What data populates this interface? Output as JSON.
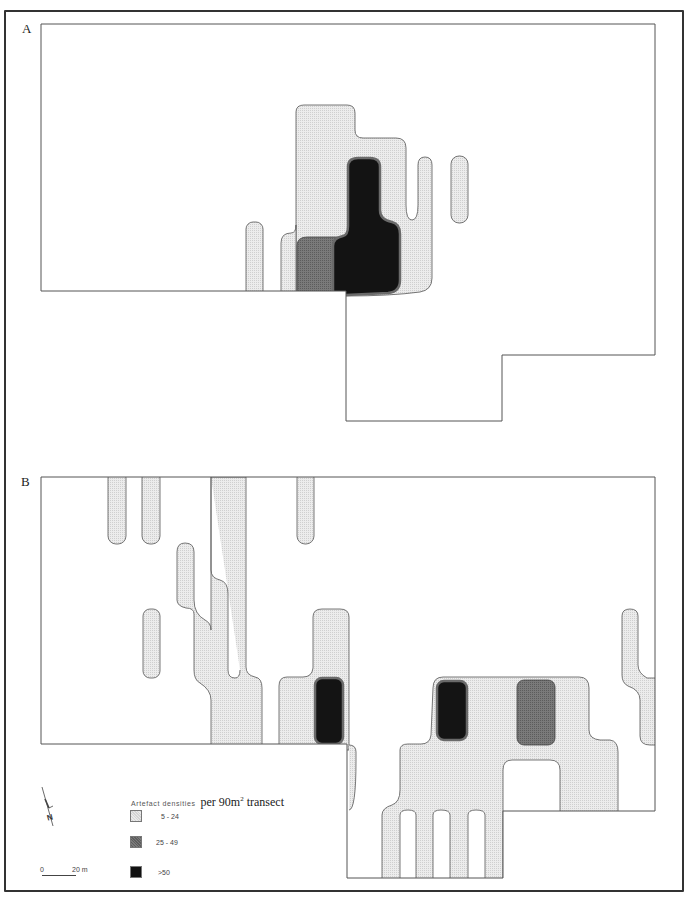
{
  "figure": {
    "panels": [
      {
        "id": "A",
        "label": "A"
      },
      {
        "id": "B",
        "label": "B"
      }
    ]
  },
  "legend": {
    "title_small": "Artefact densities",
    "title_large_prefix": "per 90m",
    "title_large_sup": "2",
    "title_large_suffix": " transect",
    "classes": [
      {
        "label": "5 - 24",
        "fill": "#e6e6e6",
        "name": "low"
      },
      {
        "label": "25 - 49",
        "fill": "#777777",
        "name": "medium"
      },
      {
        "label": ">50",
        "fill": "#111111",
        "name": "high"
      }
    ]
  },
  "north_arrow": {
    "label": "N"
  },
  "scale_bar": {
    "start": "0",
    "end": "20 m"
  },
  "colors": {
    "low": "#e3e3e3",
    "medium": "#707070",
    "high": "#141414",
    "outline": "#555555"
  }
}
